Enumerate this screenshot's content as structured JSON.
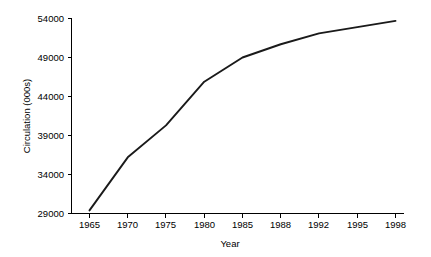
{
  "chart_data": {
    "type": "line",
    "title": "",
    "xlabel": "Year",
    "ylabel": "Circulation (000s)",
    "categories": [
      "1965",
      "1970",
      "1975",
      "1980",
      "1985",
      "1988",
      "1992",
      "1995",
      "1998"
    ],
    "values": [
      29400,
      36200,
      40300,
      45900,
      49000,
      50700,
      52100,
      52900,
      53700
    ],
    "series": [
      {
        "name": "Circulation",
        "values": [
          29400,
          36200,
          40300,
          45900,
          49000,
          50700,
          52100,
          52900,
          53700
        ]
      }
    ],
    "ylim": [
      29000,
      54000
    ],
    "yticks": [
      29000,
      34000,
      39000,
      44000,
      49000,
      54000
    ],
    "ytick_labels": [
      "29000",
      "34000",
      "39000",
      "44000",
      "49000",
      "54000"
    ],
    "xtick_labels": [
      "1965",
      "1970",
      "1975",
      "1980",
      "1985",
      "1988",
      "1992",
      "1995",
      "1998"
    ],
    "grid": false,
    "legend": false,
    "legend_position": "none",
    "line_color": "#1a1a1a",
    "background_color": "#ffffff",
    "axis_color": "#000000",
    "x_axis_spacing": "categorical-even"
  },
  "axes": {
    "y_title": "Circulation (000s)",
    "x_title": "Year"
  }
}
